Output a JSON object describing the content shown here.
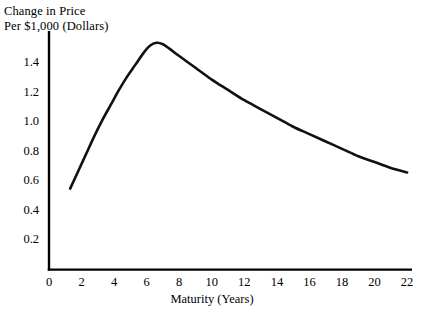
{
  "chart_data": {
    "type": "line",
    "title": "",
    "ylabel": "Change in Price Per $1,000 (Dollars)",
    "ylabel_lines": [
      "Change in Price",
      "Per $1,000 (Dollars)"
    ],
    "xlabel": "Maturity (Years)",
    "xlim": [
      0,
      22.3
    ],
    "ylim": [
      0,
      1.62
    ],
    "grid": false,
    "legend": null,
    "xticks": [
      0,
      2,
      4,
      6,
      8,
      10,
      12,
      14,
      16,
      18,
      20,
      22
    ],
    "xtick_labels": [
      "0",
      "2",
      "4",
      "6",
      "8",
      "10",
      "12",
      "14",
      "16",
      "18",
      "20",
      "22"
    ],
    "yticks": [
      0.2,
      0.4,
      0.6,
      0.8,
      1.0,
      1.2,
      1.4
    ],
    "ytick_labels": [
      "0.2",
      "0.4",
      "0.6",
      "0.8",
      "1.0",
      "1.2",
      "1.4"
    ],
    "series": [
      {
        "name": "Change in Price per $1,000",
        "color": "#111111",
        "linewidth": 2.6,
        "x": [
          1.3,
          1.8,
          2.3,
          2.8,
          3.3,
          3.8,
          4.3,
          4.8,
          5.3,
          5.8,
          6.2,
          6.6,
          7.0,
          7.4,
          8.0,
          9.0,
          10.0,
          11.0,
          12.0,
          13.0,
          14.0,
          15.0,
          16.0,
          17.0,
          18.0,
          19.0,
          20.0,
          21.0,
          22.0
        ],
        "y": [
          0.55,
          0.67,
          0.79,
          0.91,
          1.02,
          1.12,
          1.22,
          1.31,
          1.39,
          1.47,
          1.52,
          1.54,
          1.53,
          1.5,
          1.45,
          1.37,
          1.29,
          1.22,
          1.15,
          1.09,
          1.03,
          0.97,
          0.92,
          0.87,
          0.82,
          0.77,
          0.73,
          0.69,
          0.66
        ]
      }
    ],
    "axis_color": "#000000",
    "background": "#ffffff"
  }
}
